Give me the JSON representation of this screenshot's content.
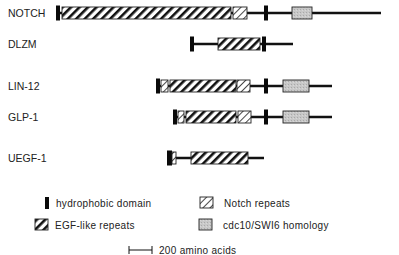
{
  "colors": {
    "line": "#111111",
    "hydrophobic": "#0a0a0a",
    "cdc10_fill": "#c4c4c4",
    "box_stroke": "#222222",
    "background": "#ffffff"
  },
  "proteins": [
    {
      "name": "NOTCH",
      "y": 13,
      "line": [
        57,
        381
      ],
      "segments": [
        {
          "type": "hydrophobic",
          "x": 56,
          "w": 4
        },
        {
          "type": "egf",
          "x": 62,
          "w": 169
        },
        {
          "type": "notch",
          "x": 233,
          "w": 14
        },
        {
          "type": "hydrophobic",
          "x": 264,
          "w": 4
        },
        {
          "type": "cdc10",
          "x": 292,
          "w": 20
        }
      ]
    },
    {
      "name": "DLZM",
      "y": 44,
      "line": [
        190,
        293
      ],
      "segments": [
        {
          "type": "hydrophobic",
          "x": 190,
          "w": 4
        },
        {
          "type": "egf",
          "x": 218,
          "w": 42
        },
        {
          "type": "hydrophobic",
          "x": 262,
          "w": 4
        }
      ]
    },
    {
      "name": "LIN-12",
      "y": 86,
      "line": [
        156,
        332
      ],
      "segments": [
        {
          "type": "hydrophobic",
          "x": 156,
          "w": 4
        },
        {
          "type": "notch",
          "x": 161,
          "w": 7
        },
        {
          "type": "egf",
          "x": 170,
          "w": 66
        },
        {
          "type": "notch",
          "x": 237,
          "w": 13
        },
        {
          "type": "hydrophobic",
          "x": 264,
          "w": 4
        },
        {
          "type": "cdc10",
          "x": 283,
          "w": 26
        }
      ]
    },
    {
      "name": "GLP-1",
      "y": 117,
      "line": [
        173,
        332
      ],
      "segments": [
        {
          "type": "hydrophobic",
          "x": 173,
          "w": 4
        },
        {
          "type": "notch",
          "x": 178,
          "w": 6
        },
        {
          "type": "egf",
          "x": 186,
          "w": 50
        },
        {
          "type": "notch",
          "x": 238,
          "w": 13
        },
        {
          "type": "hydrophobic",
          "x": 264,
          "w": 4
        },
        {
          "type": "cdc10",
          "x": 283,
          "w": 26
        }
      ]
    },
    {
      "name": "UEGF-1",
      "y": 158,
      "line": [
        167,
        264
      ],
      "segments": [
        {
          "type": "hydrophobic",
          "x": 167,
          "w": 5
        },
        {
          "type": "notch",
          "x": 172,
          "w": 4
        },
        {
          "type": "egf",
          "x": 191,
          "w": 57
        }
      ]
    }
  ],
  "legend": {
    "items": [
      {
        "type": "hydrophobic",
        "label": "hydrophobic domain",
        "icon_x": 45,
        "icon_y": 197,
        "text_x": 56,
        "text_y": 207
      },
      {
        "type": "notch",
        "label": "Notch  repeats",
        "icon_x": 200,
        "icon_y": 197,
        "text_x": 224,
        "text_y": 207
      },
      {
        "type": "egf",
        "label": "EGF-like  repeats",
        "icon_x": 35,
        "icon_y": 219,
        "text_x": 55,
        "text_y": 229
      },
      {
        "type": "cdc10",
        "label": "cdc10/SWI6  homology",
        "icon_x": 199,
        "icon_y": 219,
        "text_x": 223,
        "text_y": 229
      }
    ],
    "scale": {
      "label": "200  amino  acids",
      "x1": 129,
      "x2": 152,
      "y": 250,
      "text_x": 159
    }
  }
}
